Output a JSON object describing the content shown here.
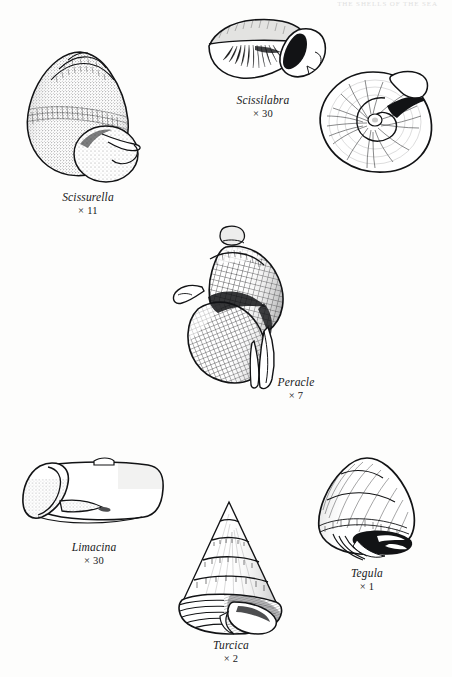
{
  "page": {
    "running_head": "THE SHELLS OF THE SEA",
    "background_color": "#fdfdfc",
    "ink_color": "#17181a",
    "width": 452,
    "height": 677,
    "plate_type": "scientific-illustration-plate"
  },
  "figures": [
    {
      "id": "scissurella",
      "genus": "Scissurella",
      "magnification": "× 11",
      "view": "apertural view",
      "description": "globose shell with conical spire, stippled shading, rounded aperture at lower right"
    },
    {
      "id": "scissilabra",
      "genus": "Scissilabra",
      "magnification": "× 30",
      "view": "lateral view",
      "description": "elongate depressed shell with dark aperture on the right"
    },
    {
      "id": "scissilabra-apical",
      "genus": "",
      "magnification": "",
      "view": "apical view",
      "description": "circular coiled shell seen from above with radial striations"
    },
    {
      "id": "peracle",
      "genus": "Peracle",
      "magnification": "× 7",
      "view": "apertural view",
      "description": "coiled shell with reticulate cross-hatched surface sculpture"
    },
    {
      "id": "limacina",
      "genus": "Limacina",
      "magnification": "× 30",
      "view": "lateral view",
      "description": "low horizontal shell with broad curved aperture at the left"
    },
    {
      "id": "turcica",
      "genus": "Turcica",
      "magnification": "× 2",
      "view": "apertural view",
      "description": "high conical shell with beaded spiral cords on each whorl"
    },
    {
      "id": "tegula",
      "genus": "Tegula",
      "magnification": "× 1",
      "view": "apertural view",
      "description": "broad trochiform shell with dark aperture and columellar tooth"
    }
  ]
}
